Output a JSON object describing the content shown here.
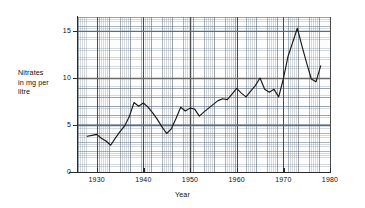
{
  "chart_data": {
    "type": "line",
    "title": "",
    "xlabel": "Year",
    "ylabel": "Nitrates in mg per litre",
    "ylabel_lines": "Nitrates\nin mg per\nlitre",
    "xlim": [
      1926,
      1980
    ],
    "ylim": [
      0,
      16.5
    ],
    "grid": true,
    "legend": "none",
    "xticks": [
      1930,
      1940,
      1950,
      1960,
      1970,
      1980
    ],
    "xtick_labels": [
      "1930",
      "1940",
      "1950",
      "1960",
      "1970",
      "1980"
    ],
    "yticks": [
      0,
      5,
      10,
      15
    ],
    "ytick_labels": [
      "0",
      "5",
      "10",
      "15"
    ],
    "series": [
      {
        "name": "Nitrates",
        "color": "#1a1a1a",
        "x": [
          1928,
          1929,
          1930,
          1931,
          1932,
          1933,
          1934,
          1935,
          1936,
          1937,
          1938,
          1939,
          1940,
          1941,
          1942,
          1943,
          1944,
          1945,
          1946,
          1947,
          1948,
          1949,
          1950,
          1951,
          1952,
          1953,
          1954,
          1955,
          1956,
          1957,
          1958,
          1959,
          1960,
          1961,
          1962,
          1963,
          1964,
          1965,
          1966,
          1967,
          1968,
          1969,
          1970,
          1971,
          1972,
          1973,
          1974,
          1975,
          1976,
          1977,
          1978
        ],
        "values": [
          3.8,
          3.9,
          4.0,
          3.6,
          3.3,
          2.85,
          3.6,
          4.3,
          4.9,
          5.9,
          7.4,
          7.0,
          7.35,
          6.9,
          6.3,
          5.6,
          4.8,
          4.1,
          4.6,
          5.7,
          6.9,
          6.5,
          6.8,
          6.7,
          5.95,
          6.4,
          6.8,
          7.2,
          7.6,
          7.8,
          7.7,
          8.3,
          8.9,
          8.4,
          8.0,
          8.6,
          9.2,
          10.0,
          8.8,
          8.5,
          8.8,
          8.0,
          9.9,
          12.3,
          13.8,
          15.3,
          13.4,
          11.6,
          9.9,
          9.6,
          11.3
        ]
      }
    ]
  },
  "axes": {
    "y_title": "Nitrates\nin mg per\nlitre",
    "x_title": "Year"
  }
}
